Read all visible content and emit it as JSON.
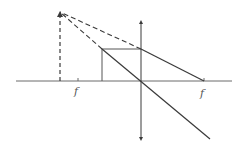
{
  "diagram": {
    "type": "thin-lens ray diagram (converging lens, virtual image)",
    "colors": {
      "background": "#ffffff",
      "line": "#3a3a3a",
      "axis": "#6a6a6a"
    },
    "optical_axis": {
      "x1": 16,
      "y1": 81,
      "x2": 232,
      "y2": 81
    },
    "lens": {
      "x": 141,
      "y_top": 18,
      "y_bottom": 143
    },
    "object": {
      "x": 102,
      "y_base": 81,
      "y_top": 49
    },
    "image": {
      "x": 60,
      "y_base": 81,
      "y_top": 12,
      "style": "dashed"
    },
    "focal_points": [
      {
        "label": "f",
        "x": 78,
        "y": 81,
        "label_x": 75,
        "label_y": 95
      },
      {
        "label": "f",
        "x": 204,
        "y": 81,
        "label_x": 201,
        "label_y": 97
      }
    ],
    "rays": [
      {
        "name": "parallel-ray-in",
        "x1": 102,
        "y1": 49,
        "x2": 141,
        "y2": 49,
        "style": "solid"
      },
      {
        "name": "parallel-ray-out",
        "x1": 141,
        "y1": 49,
        "x2": 204,
        "y2": 81,
        "style": "solid"
      },
      {
        "name": "central-ray",
        "x1": 102,
        "y1": 49,
        "x2": 210,
        "y2": 139,
        "style": "solid"
      },
      {
        "name": "extension-parallel",
        "x1": 141,
        "y1": 49,
        "x2": 60,
        "y2": 12,
        "style": "dashed"
      },
      {
        "name": "extension-central",
        "x1": 102,
        "y1": 49,
        "x2": 60,
        "y2": 12,
        "style": "dashed"
      }
    ],
    "labels": {
      "focal_left": "f",
      "focal_right": "f"
    }
  }
}
